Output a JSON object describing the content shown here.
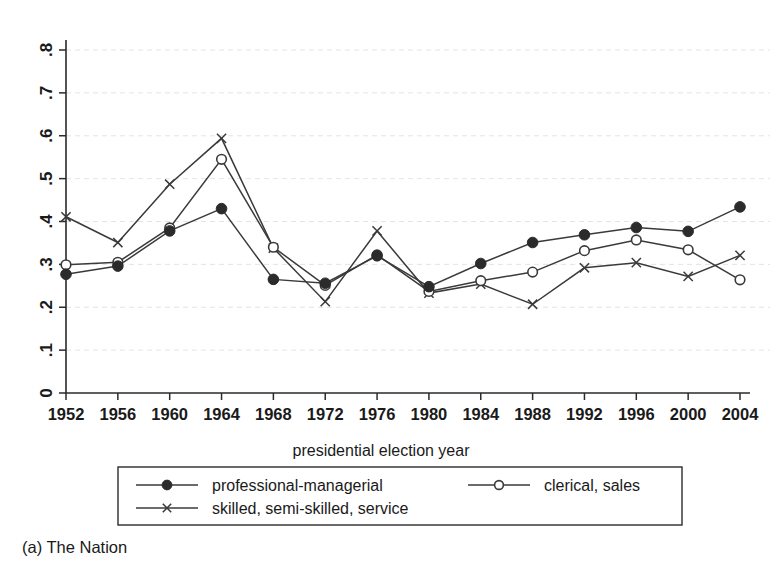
{
  "caption": "(a) The Nation",
  "chart_data": {
    "type": "line",
    "title": "",
    "xlabel": "presidential election year",
    "ylabel": "",
    "x": [
      1952,
      1956,
      1960,
      1964,
      1968,
      1972,
      1976,
      1980,
      1984,
      1988,
      1992,
      1996,
      2000,
      2004
    ],
    "categories": [
      "1952",
      "1956",
      "1960",
      "1964",
      "1968",
      "1972",
      "1976",
      "1980",
      "1984",
      "1988",
      "1992",
      "1996",
      "2000",
      "2004"
    ],
    "xlim": [
      1952,
      2004
    ],
    "ylim": [
      0,
      0.8
    ],
    "yticks": [
      0,
      0.1,
      0.2,
      0.3,
      0.4,
      0.5,
      0.6,
      0.7,
      0.8
    ],
    "ytick_labels": [
      "0",
      ".1",
      ".2",
      ".3",
      ".4",
      ".5",
      ".6",
      ".7",
      ".8"
    ],
    "grid": true,
    "legend_position": "below-axes",
    "series": [
      {
        "name": "professional-managerial",
        "marker": "filled-circle",
        "values": [
          0.277,
          0.296,
          0.378,
          0.43,
          0.265,
          0.256,
          0.32,
          0.248,
          0.302,
          0.351,
          0.369,
          0.386,
          0.377,
          0.434
        ]
      },
      {
        "name": "clerical, sales",
        "marker": "open-circle",
        "values": [
          0.299,
          0.305,
          0.385,
          0.545,
          0.34,
          0.251,
          0.322,
          0.237,
          0.262,
          0.282,
          0.332,
          0.357,
          0.334,
          0.264
        ]
      },
      {
        "name": "skilled, semi-skilled, service",
        "marker": "cross-x",
        "values": [
          0.411,
          0.351,
          0.487,
          0.594,
          0.338,
          0.213,
          0.378,
          0.233,
          0.254,
          0.207,
          0.292,
          0.304,
          0.272,
          0.321
        ]
      }
    ]
  },
  "legend": {
    "entries": [
      {
        "label": "professional-managerial",
        "marker": "filled-circle"
      },
      {
        "label": "clerical, sales",
        "marker": "open-circle"
      },
      {
        "label": "skilled, semi-skilled, service",
        "marker": "cross-x"
      }
    ]
  }
}
